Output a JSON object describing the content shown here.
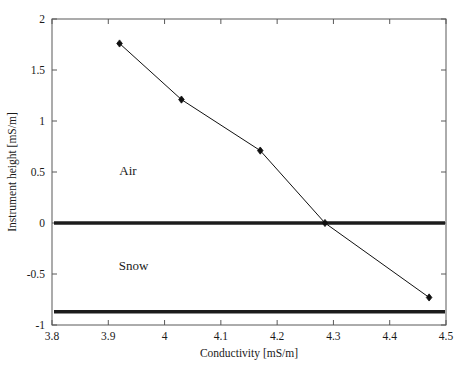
{
  "chart_data": {
    "type": "line",
    "title": "",
    "xlabel": "Conductivity [mS/m]",
    "ylabel": "Instrument height [mS/m]",
    "xlim": [
      3.8,
      4.5
    ],
    "ylim": [
      -1,
      2
    ],
    "xticks": [
      3.8,
      3.9,
      4.0,
      4.1,
      4.2,
      4.3,
      4.4,
      4.5
    ],
    "xtick_labels": [
      "3.8",
      "3.9",
      "4",
      "4.1",
      "4.2",
      "4.3",
      "4.4",
      "4.5"
    ],
    "yticks": [
      2,
      1.5,
      1,
      0.5,
      0,
      -0.5,
      -1
    ],
    "ytick_labels": [
      "2",
      "1.5",
      "1",
      "0.5",
      "0",
      "-0.5",
      "-1"
    ],
    "grid": false,
    "legend": null,
    "series": [
      {
        "name": "measurement",
        "marker": "diamond",
        "color": "#101010",
        "x": [
          3.92,
          4.03,
          4.17,
          4.285,
          4.47
        ],
        "y": [
          1.76,
          1.21,
          0.71,
          0.0,
          -0.73
        ]
      }
    ],
    "hlines": [
      {
        "name": "air-snow-interface",
        "y": 0.0,
        "color": "#1c1c1c",
        "width": 3.4
      },
      {
        "name": "snow-ground-interface",
        "y": -0.87,
        "color": "#1c1c1c",
        "width": 3.4
      }
    ],
    "annotations": [
      {
        "name": "air",
        "text": "Air",
        "x": 3.935,
        "y": 0.47
      },
      {
        "name": "snow",
        "text": "Snow",
        "x": 3.945,
        "y": -0.46
      }
    ]
  }
}
